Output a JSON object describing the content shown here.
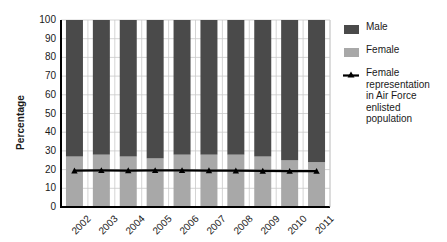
{
  "chart_data": {
    "type": "bar",
    "subtype": "stacked-bar-with-line-overlay",
    "title": "",
    "xlabel": "",
    "ylabel": "Percentage",
    "ylim": [
      0,
      100
    ],
    "ytick_step": 10,
    "ytick_labels": [
      "100",
      "90",
      "80",
      "70",
      "60",
      "50",
      "40",
      "30",
      "20",
      "10",
      "0"
    ],
    "categories": [
      "2002",
      "2003",
      "2004",
      "2005",
      "2006",
      "2007",
      "2008",
      "2009",
      "2010",
      "2011"
    ],
    "grid": true,
    "grid_axis": "y",
    "legend_position": "right",
    "series": [
      {
        "name": "Male",
        "kind": "bar",
        "color": "#4a4a4a",
        "values": [
          73,
          72,
          73,
          74,
          72,
          72,
          72,
          73,
          75,
          76
        ]
      },
      {
        "name": "Female",
        "kind": "bar",
        "color": "#a8a8a8",
        "values": [
          27,
          28,
          27,
          26,
          28,
          28,
          28,
          27,
          25,
          24
        ]
      },
      {
        "name": "Female representation in Air Force enlisted population",
        "kind": "line",
        "color": "#000000",
        "marker": "triangle",
        "values": [
          19.4,
          19.6,
          19.5,
          19.6,
          19.6,
          19.5,
          19.4,
          19.3,
          19.2,
          19.2
        ]
      }
    ]
  },
  "legend": {
    "items": [
      {
        "label": "Male",
        "type": "swatch",
        "color": "#4a4a4a"
      },
      {
        "label": "Female",
        "type": "swatch",
        "color": "#a8a8a8"
      },
      {
        "label": "Female\nrepresentation\nin Air Force\nenlisted\npopulation",
        "type": "line-marker",
        "color": "#000000"
      }
    ]
  },
  "axes": {
    "y_title": "Percentage"
  }
}
